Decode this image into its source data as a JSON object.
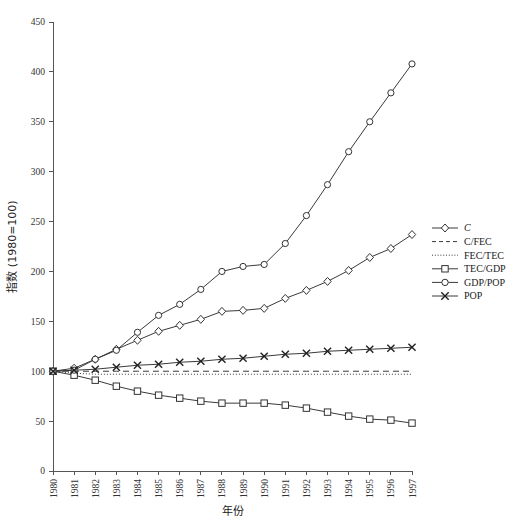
{
  "chart_data": {
    "type": "line",
    "title": "",
    "xlabel": "年份",
    "ylabel": "指数 (1980=100)",
    "xlim": [
      1980,
      1997
    ],
    "ylim": [
      0,
      450
    ],
    "ytick_step": 50,
    "grid": false,
    "legend_position": "right",
    "x": [
      1980,
      1981,
      1982,
      1983,
      1984,
      1985,
      1986,
      1987,
      1988,
      1989,
      1990,
      1991,
      1992,
      1993,
      1994,
      1995,
      1996,
      1997
    ],
    "categories": [
      "1980",
      "1981",
      "1982",
      "1983",
      "1984",
      "1985",
      "1986",
      "1987",
      "1988",
      "1989",
      "1990",
      "1991",
      "1992",
      "1993",
      "1994",
      "1995",
      "1996",
      "1997"
    ],
    "yticks": [
      0,
      50,
      100,
      150,
      200,
      250,
      300,
      350,
      400,
      450
    ],
    "ytick_labels": [
      "0",
      "50",
      "100",
      "150",
      "200",
      "250",
      "300",
      "350",
      "400",
      "450"
    ],
    "series": [
      {
        "name": "C",
        "marker": "diamond",
        "linestyle": "solid",
        "italic_label": true,
        "values": [
          100,
          103,
          112,
          122,
          131,
          140,
          146,
          152,
          160,
          161,
          163,
          173,
          181,
          190,
          201,
          214,
          223,
          237
        ]
      },
      {
        "name": "C/FEC",
        "marker": "none",
        "linestyle": "dashed",
        "italic_label": false,
        "values": [
          100,
          100,
          100,
          100,
          100,
          100,
          100,
          100,
          100,
          100,
          100,
          100,
          100,
          100,
          100,
          100,
          100,
          100
        ]
      },
      {
        "name": "FEC/TEC",
        "marker": "none",
        "linestyle": "dotted",
        "italic_label": false,
        "values": [
          100,
          98,
          97,
          97,
          97,
          97,
          97,
          97,
          97,
          97,
          97,
          97,
          97,
          97,
          97,
          97,
          97,
          97
        ]
      },
      {
        "name": "TEC/GDP",
        "marker": "square",
        "linestyle": "solid",
        "italic_label": false,
        "values": [
          100,
          96,
          91,
          85,
          80,
          76,
          73,
          70,
          68,
          68,
          68,
          66,
          63,
          59,
          55,
          52,
          51,
          48
        ]
      },
      {
        "name": "GDP/POP",
        "marker": "circle",
        "linestyle": "solid",
        "italic_label": false,
        "values": [
          100,
          101,
          112,
          121,
          139,
          156,
          167,
          182,
          200,
          205,
          207,
          228,
          256,
          287,
          320,
          350,
          379,
          408
        ]
      },
      {
        "name": "POP",
        "marker": "x",
        "linestyle": "solid",
        "italic_label": false,
        "values": [
          100,
          101,
          102,
          104,
          106,
          107,
          109,
          110,
          112,
          113,
          115,
          117,
          118,
          120,
          121,
          122,
          123,
          124
        ]
      }
    ]
  },
  "legend": {
    "items": [
      {
        "label": "C",
        "marker": "diamond",
        "linestyle": "solid",
        "italic": true
      },
      {
        "label": "C/FEC",
        "marker": "none",
        "linestyle": "dashed",
        "italic": false
      },
      {
        "label": "FEC/TEC",
        "marker": "none",
        "linestyle": "dotted",
        "italic": false
      },
      {
        "label": "TEC/GDP",
        "marker": "square",
        "linestyle": "solid",
        "italic": false
      },
      {
        "label": "GDP/POP",
        "marker": "circle",
        "linestyle": "solid",
        "italic": false
      },
      {
        "label": "POP",
        "marker": "x",
        "linestyle": "solid",
        "italic": false
      }
    ]
  },
  "colors": {
    "line": "#3a3a3a",
    "axis": "#555555",
    "text": "#222222",
    "background": "#ffffff"
  }
}
